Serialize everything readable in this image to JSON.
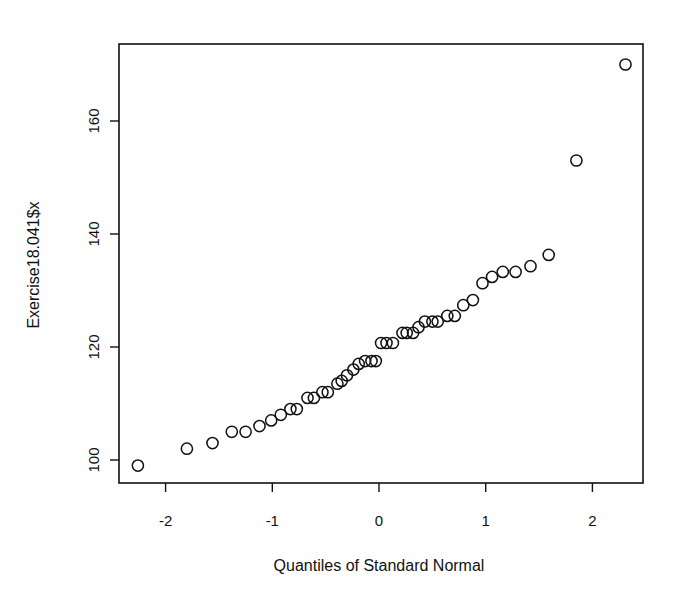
{
  "chart_data": {
    "type": "scatter",
    "title": "",
    "xlabel": "Quantiles of Standard Normal",
    "ylabel": "Exercise18.041$x",
    "xlim": [
      -2.45,
      2.45
    ],
    "ylim": [
      96.5,
      173
    ],
    "x_ticks": [
      -2,
      -1,
      0,
      1,
      2
    ],
    "x_tick_labels": [
      "-2",
      "-1",
      "0",
      "1",
      "2"
    ],
    "y_ticks": [
      100,
      120,
      140,
      160
    ],
    "y_tick_labels": [
      "100",
      "120",
      "140",
      "160"
    ],
    "grid": false,
    "legend": null,
    "marker": "open-circle",
    "points": [
      {
        "x": -2.26,
        "y": 99
      },
      {
        "x": -1.8,
        "y": 102
      },
      {
        "x": -1.56,
        "y": 103
      },
      {
        "x": -1.38,
        "y": 105
      },
      {
        "x": -1.25,
        "y": 105
      },
      {
        "x": -1.12,
        "y": 106
      },
      {
        "x": -1.01,
        "y": 107
      },
      {
        "x": -0.92,
        "y": 108
      },
      {
        "x": -0.83,
        "y": 109
      },
      {
        "x": -0.77,
        "y": 109
      },
      {
        "x": -0.67,
        "y": 111
      },
      {
        "x": -0.61,
        "y": 111
      },
      {
        "x": -0.53,
        "y": 112
      },
      {
        "x": -0.48,
        "y": 112
      },
      {
        "x": -0.39,
        "y": 113.5
      },
      {
        "x": -0.35,
        "y": 114
      },
      {
        "x": -0.3,
        "y": 115
      },
      {
        "x": -0.24,
        "y": 116
      },
      {
        "x": -0.19,
        "y": 117
      },
      {
        "x": -0.13,
        "y": 117.5
      },
      {
        "x": -0.07,
        "y": 117.5
      },
      {
        "x": -0.03,
        "y": 117.5
      },
      {
        "x": 0.02,
        "y": 120.7
      },
      {
        "x": 0.07,
        "y": 120.7
      },
      {
        "x": 0.13,
        "y": 120.7
      },
      {
        "x": 0.22,
        "y": 122.5
      },
      {
        "x": 0.26,
        "y": 122.5
      },
      {
        "x": 0.32,
        "y": 122.5
      },
      {
        "x": 0.37,
        "y": 123.5
      },
      {
        "x": 0.43,
        "y": 124.5
      },
      {
        "x": 0.5,
        "y": 124.5
      },
      {
        "x": 0.55,
        "y": 124.5
      },
      {
        "x": 0.64,
        "y": 125.5
      },
      {
        "x": 0.71,
        "y": 125.5
      },
      {
        "x": 0.79,
        "y": 127.4
      },
      {
        "x": 0.88,
        "y": 128.3
      },
      {
        "x": 0.97,
        "y": 131.3
      },
      {
        "x": 1.06,
        "y": 132.4
      },
      {
        "x": 1.16,
        "y": 133.3
      },
      {
        "x": 1.28,
        "y": 133.3
      },
      {
        "x": 1.42,
        "y": 134.3
      },
      {
        "x": 1.59,
        "y": 136.3
      },
      {
        "x": 1.85,
        "y": 153
      },
      {
        "x": 2.31,
        "y": 170
      }
    ]
  },
  "colors": {
    "background": "#ffffff",
    "foreground": "#111111"
  }
}
